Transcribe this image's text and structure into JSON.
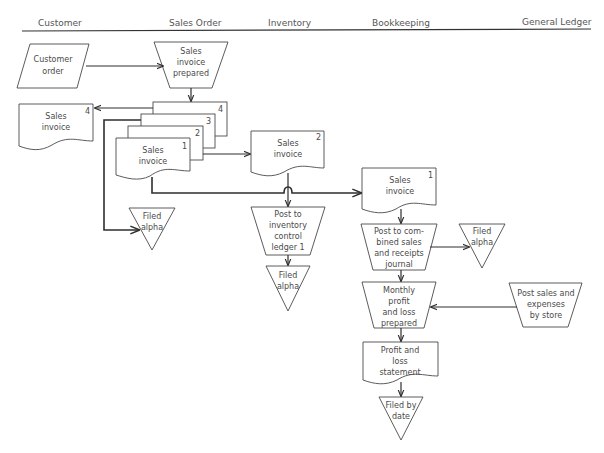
{
  "diagram": {
    "type": "flowchart",
    "swimlanes": [
      {
        "id": "customer",
        "label": "Customer"
      },
      {
        "id": "sales_order",
        "label": "Sales Order"
      },
      {
        "id": "inventory",
        "label": "Inventory"
      },
      {
        "id": "bookkeeping",
        "label": "Bookkeeping"
      },
      {
        "id": "general_ledger",
        "label": "General Ledger"
      }
    ],
    "nodes": {
      "customer_order": {
        "shape": "parallelogram-input",
        "lines": [
          "Customer",
          "order"
        ]
      },
      "invoice_prepared": {
        "shape": "trapezoid-manual-operation",
        "lines": [
          "Sales",
          "invoice",
          "prepared"
        ]
      },
      "invoice_stack": {
        "shape": "multi-document",
        "copies": [
          "4",
          "3",
          "2",
          "1"
        ],
        "front_lines": [
          "Sales",
          "invoice"
        ]
      },
      "invoice_copy4": {
        "shape": "document",
        "copy": "4",
        "lines": [
          "Sales",
          "invoice"
        ]
      },
      "filed_alpha_sales": {
        "shape": "triangle-file",
        "lines": [
          "Filed",
          "alpha"
        ]
      },
      "invoice_copy2": {
        "shape": "document",
        "copy": "2",
        "lines": [
          "Sales",
          "invoice"
        ]
      },
      "post_inventory": {
        "shape": "trapezoid-manual-operation",
        "lines": [
          "Post to",
          "inventory",
          "control",
          "ledger 1"
        ]
      },
      "filed_alpha_inventory": {
        "shape": "triangle-file",
        "lines": [
          "Filed",
          "alpha"
        ]
      },
      "invoice_copy1": {
        "shape": "document",
        "copy": "1",
        "lines": [
          "Sales",
          "invoice"
        ]
      },
      "post_journal": {
        "shape": "trapezoid-manual-operation",
        "lines": [
          "Post to com-",
          "bined sales",
          "and receipts",
          "journal"
        ]
      },
      "filed_alpha_bookkeeping": {
        "shape": "triangle-file",
        "lines": [
          "Filed",
          "alpha"
        ]
      },
      "monthly_pl": {
        "shape": "trapezoid-manual-operation",
        "lines": [
          "Monthly",
          "profit",
          "and loss",
          "prepared"
        ]
      },
      "post_sales_expenses": {
        "shape": "parallelogram-input",
        "lines": [
          "Post sales and",
          "expenses",
          "by store"
        ]
      },
      "pl_statement": {
        "shape": "document",
        "lines": [
          "Profit and",
          "loss",
          "statement"
        ]
      },
      "filed_by_date": {
        "shape": "triangle-file",
        "lines": [
          "Filed by",
          "date"
        ]
      }
    },
    "edges": [
      {
        "from": "customer_order",
        "to": "invoice_prepared"
      },
      {
        "from": "invoice_prepared",
        "to": "invoice_stack"
      },
      {
        "from": "invoice_stack",
        "to": "invoice_copy4",
        "copy": "4"
      },
      {
        "from": "invoice_stack",
        "to": "filed_alpha_sales",
        "copy": "3"
      },
      {
        "from": "invoice_stack",
        "to": "invoice_copy2",
        "copy": "2"
      },
      {
        "from": "invoice_stack",
        "to": "invoice_copy1",
        "copy": "1"
      },
      {
        "from": "invoice_copy2",
        "to": "post_inventory"
      },
      {
        "from": "post_inventory",
        "to": "filed_alpha_inventory"
      },
      {
        "from": "invoice_copy1",
        "to": "post_journal"
      },
      {
        "from": "post_journal",
        "to": "filed_alpha_bookkeeping"
      },
      {
        "from": "post_journal",
        "to": "monthly_pl"
      },
      {
        "from": "post_sales_expenses",
        "to": "monthly_pl"
      },
      {
        "from": "monthly_pl",
        "to": "pl_statement"
      },
      {
        "from": "pl_statement",
        "to": "filed_by_date"
      }
    ]
  }
}
